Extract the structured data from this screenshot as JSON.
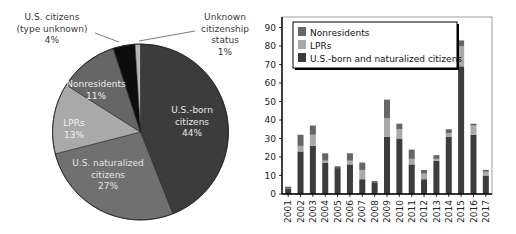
{
  "chart_data": [
    {
      "type": "pie",
      "title": "",
      "start_angle_deg": 0,
      "direction": "clockwise",
      "slices": [
        {
          "label": "U.S.-born citizens",
          "lines": [
            "U.S.-born",
            "citizens",
            "44%"
          ],
          "value": 44,
          "color": "#3c3c3c",
          "label_color": "#e6e6e6"
        },
        {
          "label": "U.S. naturalized citizens",
          "lines": [
            "U.S. naturalized",
            "citizens",
            "27%"
          ],
          "value": 27,
          "color": "#707070",
          "label_color": "#e6e6e6"
        },
        {
          "label": "LPRs",
          "lines": [
            "LPRs",
            "13%"
          ],
          "value": 13,
          "color": "#a9a9a9",
          "label_color": "#f2f2f2"
        },
        {
          "label": "Nonresidents",
          "lines": [
            "Nonresidents",
            "11%"
          ],
          "value": 11,
          "color": "#666666",
          "label_color": "#ededed"
        },
        {
          "label": "U.S. citizens (type unknown)",
          "lines": [
            "U.S. citizens",
            "(type unknown)",
            "4%"
          ],
          "value": 4,
          "color": "#0d0d0d",
          "label_color": "#3a3a3a"
        },
        {
          "label": "Unknown citizenship status",
          "lines": [
            "Unknown",
            "citizenship",
            "status",
            "1%"
          ],
          "value": 1,
          "color": "#b8b8b8",
          "label_color": "#3a3a3a"
        }
      ]
    },
    {
      "type": "bar",
      "stacked": true,
      "title": "",
      "xlabel": "",
      "ylabel": "",
      "ylim": [
        0,
        90
      ],
      "yticks": [
        0,
        10,
        20,
        30,
        40,
        50,
        60,
        70,
        80,
        90
      ],
      "grid": false,
      "legend_position": "upper-left",
      "categories": [
        "2001",
        "2002",
        "2003",
        "2004",
        "2005",
        "2006",
        "2007",
        "2008",
        "2009",
        "2010",
        "2011",
        "2012",
        "2013",
        "2014",
        "2015",
        "2016",
        "2017"
      ],
      "series": [
        {
          "name": "U.S.-born and naturalized citizens",
          "color": "#3c3c3c",
          "values": [
            3,
            23,
            26,
            17,
            14,
            16,
            8,
            6,
            31,
            30,
            16,
            8,
            18,
            31,
            69,
            32,
            10
          ]
        },
        {
          "name": "LPRs",
          "color": "#a9a9a9",
          "values": [
            0,
            3,
            6,
            1,
            0,
            2,
            5,
            0,
            10,
            5,
            3,
            3,
            1,
            2,
            11,
            5,
            2
          ]
        },
        {
          "name": "Nonresidents",
          "color": "#666666",
          "values": [
            1,
            6,
            5,
            4,
            1,
            4,
            4,
            1,
            10,
            3,
            5,
            2,
            2,
            2,
            3,
            1,
            1
          ]
        }
      ],
      "legend": [
        "Nonresidents",
        "LPRs",
        "U.S.-born and naturalized citizens"
      ]
    }
  ]
}
